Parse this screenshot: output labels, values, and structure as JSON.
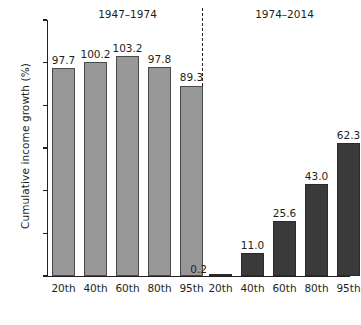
{
  "chart_data": {
    "type": "bar",
    "title": "",
    "xlabel": "",
    "ylabel": "Cumulative income growth (%)",
    "ylim": [
      0,
      120
    ],
    "yticks": [
      0,
      20,
      40,
      60,
      80,
      100,
      120
    ],
    "ytick_labels": [
      "0",
      "20",
      "40",
      "60",
      "80",
      "100",
      "120"
    ],
    "grid": false,
    "legend": "none",
    "categories": [
      "20th",
      "40th",
      "60th",
      "80th",
      "95th"
    ],
    "panels": [
      {
        "name": "1947-1974",
        "title": "1947–1974",
        "color": "#989898",
        "categories": [
          "20th",
          "40th",
          "60th",
          "80th",
          "95th"
        ],
        "values": [
          97.7,
          100.2,
          103.2,
          97.8,
          89.3
        ],
        "value_labels": [
          "97.7",
          "100.2",
          "103.2",
          "97.8",
          "89.3"
        ]
      },
      {
        "name": "1974-2014",
        "title": "1974–2014",
        "color": "#3a3a3a",
        "categories": [
          "20th",
          "40th",
          "60th",
          "80th",
          "95th"
        ],
        "values": [
          0.2,
          11.0,
          25.6,
          43.0,
          62.3
        ],
        "value_labels": [
          "0.2",
          "11.0",
          "25.6",
          "43.0",
          "62.3"
        ]
      }
    ],
    "series": [
      {
        "name": "1947–1974",
        "values": [
          97.7,
          100.2,
          103.2,
          97.8,
          89.3
        ]
      },
      {
        "name": "1974–2014",
        "values": [
          0.2,
          11.0,
          25.6,
          43.0,
          62.3
        ]
      }
    ],
    "annotations": [
      "dashed vertical divider separating the two time periods"
    ],
    "colors": {
      "period_1947_1974": "#989898",
      "period_1974_2014": "#3a3a3a",
      "axis": "#231f20",
      "background": "#ffffff"
    }
  }
}
